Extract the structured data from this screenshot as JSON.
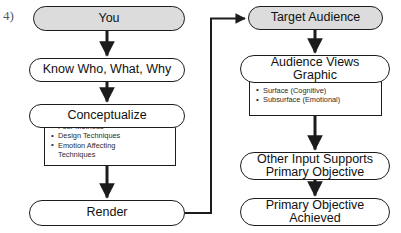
{
  "figure": {
    "label": "4)"
  },
  "colors": {
    "background": "#ffffff",
    "stroke": "#1c1c1c",
    "shaded_fill": "#dcdcdc",
    "plain_fill": "#ffffff",
    "text": "#111111",
    "figure_label": "#5a5a5a"
  },
  "left_column": {
    "you": "You",
    "know": "Know Who, What, Why",
    "conceptualize": "Conceptualize",
    "conceptualize_details": [
      "Four Methods",
      "Design Techniques",
      "Emotion Affecting\nTechniques"
    ],
    "render": "Render"
  },
  "right_column": {
    "target_audience": "Target Audience",
    "audience_views": "Audience Views\nGraphic",
    "audience_views_heading": "Two Tiers of Communication",
    "audience_views_details": [
      "Surface (Cognitive)",
      "Subsurface (Emotional)"
    ],
    "other_input": "Other Input Supports\nPrimary Objective",
    "primary_objective": "Primary Objective\nAchieved"
  }
}
